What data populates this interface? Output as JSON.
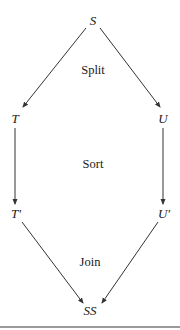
{
  "diagram": {
    "nodes": {
      "s": "S",
      "t": "T",
      "u": "U",
      "t_prime": "T′",
      "u_prime": "U′",
      "ss": "SS"
    },
    "stages": {
      "split": "Split",
      "sort": "Sort",
      "join": "Join"
    },
    "edges": [
      {
        "from": "S",
        "to": "T"
      },
      {
        "from": "S",
        "to": "U"
      },
      {
        "from": "T",
        "to": "T′"
      },
      {
        "from": "U",
        "to": "U′"
      },
      {
        "from": "T′",
        "to": "SS"
      },
      {
        "from": "U′",
        "to": "SS"
      }
    ],
    "colors": {
      "line": "#333333",
      "text": "#1a1a1a",
      "rule": "#9a9a9a"
    }
  }
}
